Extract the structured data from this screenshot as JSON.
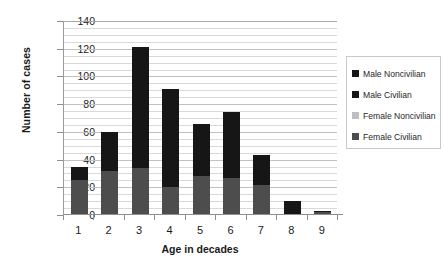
{
  "chart_data": {
    "type": "bar",
    "stacked": true,
    "title": "",
    "xlabel": "Age in decades",
    "ylabel": "Number of cases",
    "categories": [
      "1",
      "2",
      "3",
      "4",
      "5",
      "6",
      "7",
      "8",
      "9"
    ],
    "ylim": [
      0,
      140
    ],
    "yticks": [
      0,
      20,
      40,
      60,
      80,
      100,
      120,
      140
    ],
    "ytick_labels": [
      "0",
      "20",
      "40",
      "60",
      "80",
      "100",
      "120",
      "140"
    ],
    "minor_gridline_step": 5,
    "grid": true,
    "legend_position": "right",
    "series": [
      {
        "name": "Male Noncivilian",
        "color": "#161616",
        "values": [
          0,
          0,
          0,
          0,
          0,
          0,
          0,
          0,
          0
        ]
      },
      {
        "name": "Male Civilian",
        "color": "#161616",
        "values": [
          10,
          28,
          87,
          71,
          38,
          47,
          21,
          9,
          1
        ]
      },
      {
        "name": "Female Noncivilian",
        "color": "#bfbfbf",
        "values": [
          0,
          0,
          0,
          0,
          0,
          0,
          0,
          0,
          0
        ]
      },
      {
        "name": "Female Civilian",
        "color": "#4d4d4d",
        "values": [
          25,
          32,
          34,
          20,
          28,
          27,
          22,
          1,
          2
        ]
      }
    ],
    "totals": [
      35,
      60,
      121,
      91,
      66,
      74,
      43,
      10,
      3
    ]
  },
  "legend": {
    "items": [
      {
        "label": "Male Noncivilian",
        "color": "#161616"
      },
      {
        "label": "Male Civilian",
        "color": "#161616"
      },
      {
        "label": "Female Noncivilian",
        "color": "#bfbfbf"
      },
      {
        "label": "Female Civilian",
        "color": "#4d4d4d"
      }
    ]
  }
}
